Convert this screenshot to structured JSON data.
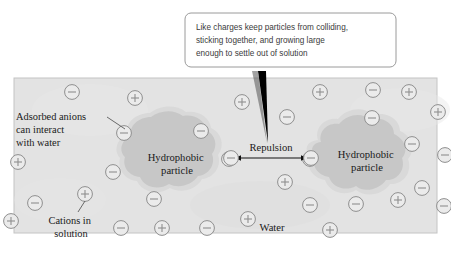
{
  "figure": {
    "name": "colloid-stabilization-diagram",
    "background_color": "#ffffff",
    "panel": {
      "fill_color": "#e3e3e3",
      "border_color": "#bdbdbd",
      "x": 14,
      "y": 78,
      "width": 423,
      "height": 155
    }
  },
  "callout": {
    "name": "explanatory-callout",
    "border_color": "#9a9a9a",
    "fill_color": "#ffffff",
    "text_color": "#3b3b3b",
    "lines": [
      "Like charges keep particles from colliding,",
      "sticking together, and growing large",
      "enough to settle out of solution"
    ],
    "pointer_color": "#000000"
  },
  "labels": {
    "adsorbed_anions": {
      "name": "adsorbed-anions-label",
      "lines": [
        "Adsorbed anions",
        "can interact",
        "with water"
      ]
    },
    "cations": {
      "name": "cations-label",
      "lines": [
        "Cations in",
        "solution"
      ]
    },
    "repulsion": {
      "name": "repulsion-label",
      "text": "Repulsion"
    },
    "water": {
      "name": "water-label",
      "text": "Water"
    },
    "particle_left": {
      "name": "hydrophobic-particle-left-label",
      "lines": [
        "Hydrophobic",
        "particle"
      ]
    },
    "particle_right": {
      "name": "hydrophobic-particle-right-label",
      "lines": [
        "Hydrophobic",
        "particle"
      ]
    }
  },
  "particles": {
    "fill_color": "#c9c9c9",
    "halo_color": "#d8d8d8",
    "left": {
      "name": "hydrophobic-particle-left",
      "cx": 163,
      "cy": 158
    },
    "right": {
      "name": "hydrophobic-particle-right",
      "cx": 362,
      "cy": 157
    }
  },
  "ions": {
    "anion_symbol": "−",
    "cation_symbol": "+",
    "stroke_color": "#8f8f8f",
    "fill_color": "#ebebeb",
    "radius": 7.4,
    "list": [
      {
        "type": "anion",
        "x": 72,
        "y": 92
      },
      {
        "type": "cation",
        "x": 135,
        "y": 98
      },
      {
        "type": "cation",
        "x": 242,
        "y": 102
      },
      {
        "type": "cation",
        "x": 320,
        "y": 92
      },
      {
        "type": "anion",
        "x": 373,
        "y": 90
      },
      {
        "type": "cation",
        "x": 409,
        "y": 92
      },
      {
        "type": "anion",
        "x": 287,
        "y": 117
      },
      {
        "type": "cation",
        "x": 438,
        "y": 112
      },
      {
        "type": "anion",
        "x": 124,
        "y": 133
      },
      {
        "type": "anion",
        "x": 201,
        "y": 131
      },
      {
        "type": "cation",
        "x": 18,
        "y": 162
      },
      {
        "type": "anion",
        "x": 372,
        "y": 118
      },
      {
        "type": "anion",
        "x": 412,
        "y": 144
      },
      {
        "type": "anion",
        "x": 229,
        "y": 159
      },
      {
        "type": "anion",
        "x": 310,
        "y": 159
      },
      {
        "type": "anion",
        "x": 113,
        "y": 172
      },
      {
        "type": "anion",
        "x": 422,
        "y": 188
      },
      {
        "type": "cation",
        "x": 285,
        "y": 182
      },
      {
        "type": "anion",
        "x": 35,
        "y": 203
      },
      {
        "type": "cation",
        "x": 85,
        "y": 194
      },
      {
        "type": "anion",
        "x": 154,
        "y": 199
      },
      {
        "type": "anion",
        "x": 310,
        "y": 205
      },
      {
        "type": "anion",
        "x": 356,
        "y": 204
      },
      {
        "type": "cation",
        "x": 398,
        "y": 200
      },
      {
        "type": "anion",
        "x": 444,
        "y": 206
      },
      {
        "type": "cation",
        "x": 11,
        "y": 221
      },
      {
        "type": "anion",
        "x": 121,
        "y": 228
      },
      {
        "type": "cation",
        "x": 162,
        "y": 228
      },
      {
        "type": "anion",
        "x": 207,
        "y": 228
      },
      {
        "type": "cation",
        "x": 330,
        "y": 230
      },
      {
        "type": "cation",
        "x": 248,
        "y": 219
      },
      {
        "type": "anion",
        "x": 445,
        "y": 155
      }
    ],
    "repulsion_pair": {
      "left": {
        "name": "repulsion-anion-left",
        "x": 231,
        "y": 158
      },
      "right": {
        "name": "repulsion-anion-right",
        "x": 311,
        "y": 158
      }
    }
  }
}
